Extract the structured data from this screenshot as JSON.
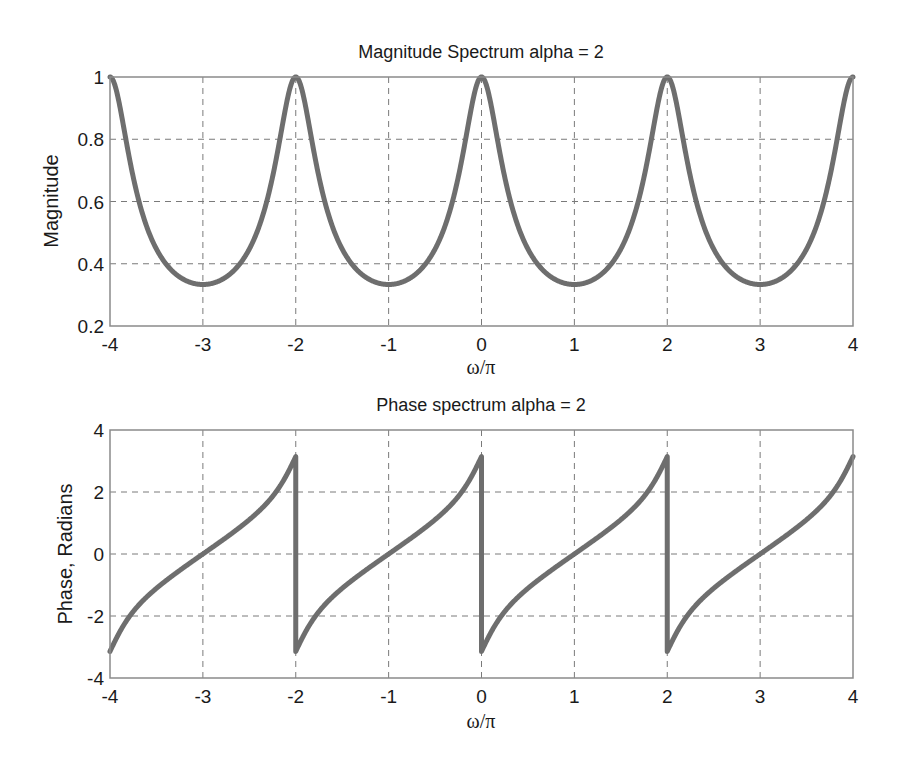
{
  "chart_data": [
    {
      "type": "line",
      "title": "Magnitude Spectrum alpha = 2",
      "xlabel": "ω/π",
      "ylabel": "Magnitude",
      "xlim": [
        -4,
        4
      ],
      "ylim": [
        0.2,
        1
      ],
      "xticks": [
        "-4",
        "-3",
        "-2",
        "-1",
        "0",
        "1",
        "2",
        "3",
        "4"
      ],
      "yticks": [
        "0.2",
        "0.4",
        "0.6",
        "0.8",
        "1"
      ],
      "grid": true,
      "series": [
        {
          "name": "|H(e^jω)|",
          "color": "#6e6e6e",
          "x": [
            -4,
            -3.75,
            -3.5,
            -3.25,
            -3,
            -2.75,
            -2.5,
            -2.25,
            -2,
            -1.75,
            -1.5,
            -1.25,
            -1,
            -0.75,
            -0.5,
            -0.25,
            0,
            0.25,
            0.5,
            0.75,
            1,
            1.25,
            1.5,
            1.75,
            2,
            2.25,
            2.5,
            2.75,
            3,
            3.25,
            3.5,
            3.75,
            4
          ],
          "values": [
            1,
            0.569,
            0.447,
            0.364,
            0.333,
            0.364,
            0.447,
            0.569,
            1,
            0.569,
            0.447,
            0.364,
            0.333,
            0.364,
            0.447,
            0.569,
            1,
            0.569,
            0.447,
            0.364,
            0.333,
            0.364,
            0.447,
            0.569,
            1,
            0.569,
            0.447,
            0.364,
            0.333,
            0.364,
            0.447,
            0.569,
            1
          ]
        }
      ]
    },
    {
      "type": "line",
      "title": "Phase spectrum alpha = 2",
      "xlabel": "ω/π",
      "ylabel": "Phase, Radians",
      "xlim": [
        -4,
        4
      ],
      "ylim": [
        -4,
        4
      ],
      "xticks": [
        "-4",
        "-3",
        "-2",
        "-1",
        "0",
        "1",
        "2",
        "3",
        "4"
      ],
      "yticks": [
        "-4",
        "-2",
        "0",
        "2",
        "4"
      ],
      "grid": true,
      "series": [
        {
          "name": "arg H(e^jω)",
          "color": "#6e6e6e",
          "x": [
            -4,
            -3.75,
            -3.5,
            -3.25,
            -3,
            -2.75,
            -2.5,
            -2.25,
            -2,
            -1.75,
            -1.5,
            -1.25,
            -1,
            -0.75,
            -0.5,
            -0.25,
            0,
            0.25,
            0.5,
            0.75,
            1,
            1.25,
            1.5,
            1.75,
            2,
            2.25,
            2.5,
            2.75,
            3,
            3.25,
            3.5,
            3.75,
            4
          ],
          "values": [
            -3.14,
            -1.85,
            -1.11,
            -0.53,
            0,
            0.53,
            1.11,
            1.85,
            3.14,
            -1.85,
            -1.11,
            -0.53,
            0,
            0.53,
            1.11,
            1.85,
            3.14,
            -1.85,
            -1.11,
            -0.53,
            0,
            0.53,
            1.11,
            1.85,
            3.14,
            -1.85,
            -1.11,
            -0.53,
            0,
            0.53,
            1.11,
            1.85,
            3.14
          ]
        }
      ]
    }
  ],
  "plots": {
    "magnitude": {
      "title": "Magnitude Spectrum alpha = 2",
      "xlabel": "ω/π",
      "ylabel": "Magnitude",
      "xticks": [
        "-4",
        "-3",
        "-2",
        "-1",
        "0",
        "1",
        "2",
        "3",
        "4"
      ],
      "yticks": [
        "0.2",
        "0.4",
        "0.6",
        "0.8",
        "1"
      ]
    },
    "phase": {
      "title": "Phase spectrum alpha = 2",
      "xlabel": "ω/π",
      "ylabel": "Phase, Radians",
      "xticks": [
        "-4",
        "-3",
        "-2",
        "-1",
        "0",
        "1",
        "2",
        "3",
        "4"
      ],
      "yticks": [
        "-4",
        "-2",
        "0",
        "2",
        "4"
      ]
    }
  },
  "style": {
    "curve_color": "#6e6e6e",
    "grid_color": "#7a7a7a",
    "frame_color": "#8a8a8a"
  },
  "model": {
    "alpha": 2
  }
}
